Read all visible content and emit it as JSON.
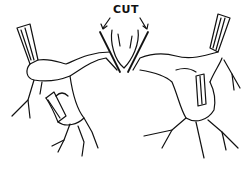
{
  "figure": {
    "label": "CUT",
    "ink_color": "#111111",
    "background": "#ffffff"
  }
}
